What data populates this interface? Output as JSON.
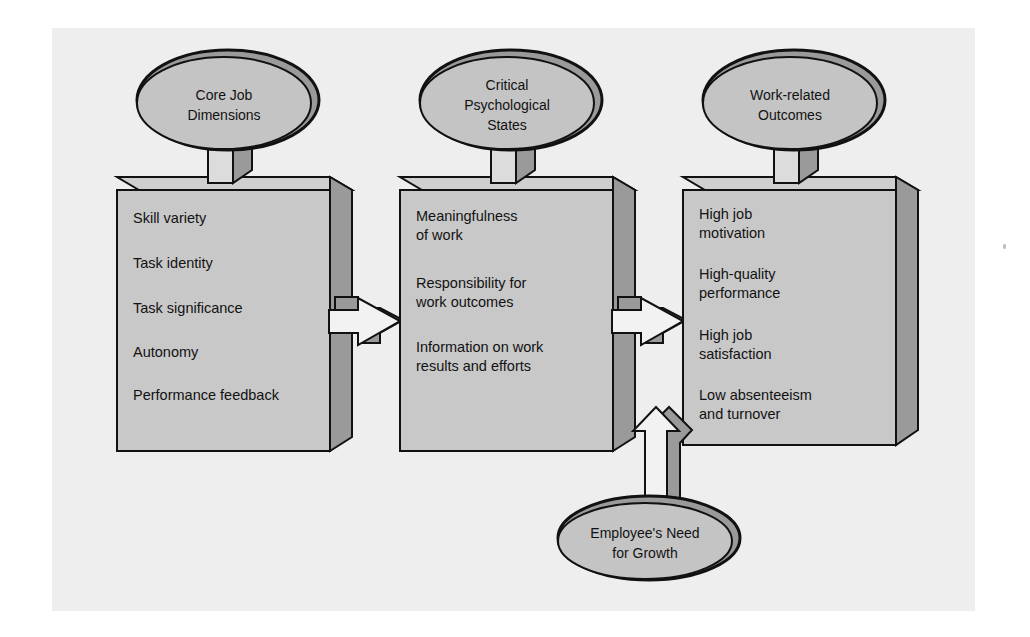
{
  "figure": {
    "background_color": "#ffffff",
    "panel_color": "#eeeeee",
    "box_face_color": "#c8c8c8",
    "box_top_color": "#cfcfcf",
    "box_side_color": "#9a9a9a",
    "ellipse_fill_color": "#c4c4c4",
    "ellipse_shade_color": "#9a9a9a",
    "outline_color": "#111111",
    "arrow_fill_color": "#f2f2f2",
    "arrow_shade_color": "#9a9a9a"
  },
  "headers": [
    {
      "id": "core-job-dimensions",
      "lines": [
        "Core Job",
        "Dimensions"
      ],
      "shape": "ellipse"
    },
    {
      "id": "critical-psychological-states",
      "lines": [
        "Critical",
        "Psychological",
        "States"
      ],
      "shape": "ellipse"
    },
    {
      "id": "work-related-outcomes",
      "lines": [
        "Work-related",
        "Outcomes"
      ],
      "shape": "ellipse"
    }
  ],
  "boxes": [
    {
      "id": "core-job-dimensions-box",
      "items": [
        {
          "lines": [
            "Skill variety"
          ]
        },
        {
          "lines": [
            "Task identity"
          ]
        },
        {
          "lines": [
            "Task significance"
          ]
        },
        {
          "lines": [
            "Autonomy"
          ]
        },
        {
          "lines": [
            "Performance feedback"
          ]
        }
      ]
    },
    {
      "id": "critical-psychological-states-box",
      "items": [
        {
          "lines": [
            "Meaningfulness",
            "of work"
          ]
        },
        {
          "lines": [
            "Responsibility for",
            "work outcomes"
          ]
        },
        {
          "lines": [
            "Information on work",
            "results and efforts"
          ]
        }
      ]
    },
    {
      "id": "work-related-outcomes-box",
      "items": [
        {
          "lines": [
            "High job",
            "motivation"
          ]
        },
        {
          "lines": [
            "High-quality",
            "performance"
          ]
        },
        {
          "lines": [
            "High job",
            "satisfaction"
          ]
        },
        {
          "lines": [
            "Low absenteeism",
            "and turnover"
          ]
        }
      ]
    }
  ],
  "moderator": {
    "id": "employee-need-for-growth",
    "lines": [
      "Employee's Need",
      "for Growth"
    ],
    "shape": "ellipse",
    "arrow_direction": "up"
  },
  "connectors": [
    {
      "id": "arrow-dimensions-to-states",
      "direction": "right"
    },
    {
      "id": "arrow-states-to-outcomes",
      "direction": "right"
    },
    {
      "id": "arrow-growth-to-outcomes",
      "direction": "up"
    }
  ]
}
